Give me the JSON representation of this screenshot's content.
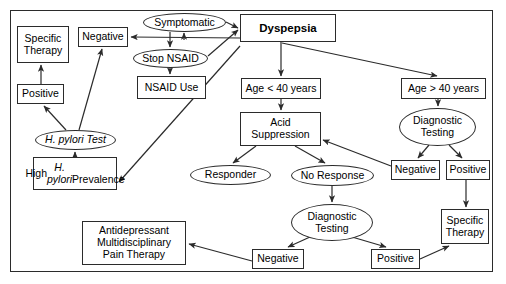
{
  "diagram": {
    "border_color": "#2b2b2b",
    "background": "#ffffff",
    "nodes": [
      {
        "id": "specific_therapy_left",
        "label": "Specific\nTherapy",
        "shape": "box",
        "x": 17,
        "y": 26,
        "w": 52,
        "h": 37
      },
      {
        "id": "negative_top",
        "label": "Negative",
        "shape": "box",
        "x": 78,
        "y": 27,
        "w": 50,
        "h": 20
      },
      {
        "id": "symptomatic",
        "label": "Symptomatic",
        "shape": "ellipse",
        "x": 143,
        "y": 13,
        "w": 83,
        "h": 19
      },
      {
        "id": "dyspepsia",
        "label": "Dyspepsia",
        "shape": "box",
        "x": 240,
        "y": 14,
        "w": 96,
        "h": 28,
        "bold": true
      },
      {
        "id": "stop_nsaid",
        "label": "Stop NSAID",
        "shape": "ellipse",
        "x": 133,
        "y": 49,
        "w": 75,
        "h": 19
      },
      {
        "id": "positive_left",
        "label": "Positive",
        "shape": "box",
        "x": 17,
        "y": 84,
        "w": 47,
        "h": 20
      },
      {
        "id": "nsaid_use",
        "label": "NSAID Use",
        "shape": "box",
        "x": 137,
        "y": 76,
        "w": 69,
        "h": 23
      },
      {
        "id": "age_under_40",
        "label": "Age < 40 years",
        "shape": "box",
        "x": 241,
        "y": 78,
        "w": 80,
        "h": 21
      },
      {
        "id": "age_over_40",
        "label": "Age > 40 years",
        "shape": "box",
        "x": 401,
        "y": 78,
        "w": 85,
        "h": 21
      },
      {
        "id": "h_pylori_test",
        "label": "H. pylori Test",
        "shape": "ellipse",
        "x": 35,
        "y": 130,
        "w": 81,
        "h": 20,
        "italic": true
      },
      {
        "id": "acid_suppression",
        "label": "Acid\nSuppression",
        "shape": "box",
        "x": 240,
        "y": 112,
        "w": 81,
        "h": 34
      },
      {
        "id": "diagnostic_testing_right",
        "label": "Diagnostic\nTesting",
        "shape": "ellipse",
        "x": 399,
        "y": 108,
        "w": 77,
        "h": 38
      },
      {
        "id": "high_h_pylori",
        "label": "High H. pylori\nPrevalence",
        "shape": "box",
        "x": 33,
        "y": 157,
        "w": 84,
        "h": 33,
        "italic_part": true
      },
      {
        "id": "responder",
        "label": "Responder",
        "shape": "ellipse",
        "x": 190,
        "y": 165,
        "w": 81,
        "h": 20
      },
      {
        "id": "no_response",
        "label": "No Response",
        "shape": "ellipse",
        "x": 291,
        "y": 165,
        "w": 83,
        "h": 21
      },
      {
        "id": "negative_right",
        "label": "Negative",
        "shape": "box",
        "x": 391,
        "y": 160,
        "w": 49,
        "h": 20
      },
      {
        "id": "positive_right",
        "label": "Positive",
        "shape": "box",
        "x": 446,
        "y": 160,
        "w": 44,
        "h": 20
      },
      {
        "id": "diagnostic_testing_mid",
        "label": "Diagnostic\nTesting",
        "shape": "ellipse",
        "x": 291,
        "y": 204,
        "w": 82,
        "h": 37
      },
      {
        "id": "specific_therapy_right",
        "label": "Specific\nTherapy",
        "shape": "box",
        "x": 441,
        "y": 209,
        "w": 48,
        "h": 35
      },
      {
        "id": "antidepressant",
        "label": "Antidepressant\nMultidisciplinary\nPain Therapy",
        "shape": "box",
        "x": 82,
        "y": 221,
        "w": 104,
        "h": 44
      },
      {
        "id": "negative_bottom",
        "label": "Negative",
        "shape": "box",
        "x": 252,
        "y": 249,
        "w": 52,
        "h": 20
      },
      {
        "id": "positive_bottom",
        "label": "Positive",
        "shape": "box",
        "x": 371,
        "y": 249,
        "w": 49,
        "h": 20
      }
    ],
    "edges": [
      {
        "from": "symptomatic",
        "to": "dyspepsia",
        "label": ""
      },
      {
        "from": "stop_nsaid",
        "to": "dyspepsia",
        "label": ""
      },
      {
        "from": "dyspepsia",
        "to": "symptomatic",
        "label": ""
      },
      {
        "from": "symptomatic",
        "to": "stop_nsaid",
        "label": ""
      },
      {
        "from": "stop_nsaid",
        "to": "nsaid_use",
        "label": ""
      },
      {
        "from": "dyspepsia",
        "to": "age_under_40",
        "label": ""
      },
      {
        "from": "dyspepsia",
        "to": "age_over_40",
        "label": ""
      },
      {
        "from": "dyspepsia",
        "to": "negative_top",
        "label": ""
      },
      {
        "from": "age_under_40",
        "to": "acid_suppression",
        "label": ""
      },
      {
        "from": "age_over_40",
        "to": "diagnostic_testing_right",
        "label": ""
      },
      {
        "from": "h_pylori_test",
        "to": "positive_left",
        "label": ""
      },
      {
        "from": "h_pylori_test",
        "to": "negative_top",
        "label": ""
      },
      {
        "from": "positive_left",
        "to": "specific_therapy_left",
        "label": ""
      },
      {
        "from": "high_h_pylori",
        "to": "h_pylori_test",
        "label": ""
      },
      {
        "from": "nsaid_use",
        "to": "high_h_pylori",
        "label": ""
      },
      {
        "from": "acid_suppression",
        "to": "responder",
        "label": ""
      },
      {
        "from": "acid_suppression",
        "to": "no_response",
        "label": ""
      },
      {
        "from": "no_response",
        "to": "diagnostic_testing_mid",
        "label": ""
      },
      {
        "from": "diagnostic_testing_right",
        "to": "negative_right",
        "label": ""
      },
      {
        "from": "diagnostic_testing_right",
        "to": "positive_right",
        "label": ""
      },
      {
        "from": "negative_right",
        "to": "acid_suppression",
        "label": ""
      },
      {
        "from": "positive_right",
        "to": "specific_therapy_right",
        "label": ""
      },
      {
        "from": "diagnostic_testing_mid",
        "to": "negative_bottom",
        "label": ""
      },
      {
        "from": "diagnostic_testing_mid",
        "to": "positive_bottom",
        "label": ""
      },
      {
        "from": "negative_bottom",
        "to": "antidepressant",
        "label": ""
      },
      {
        "from": "positive_bottom",
        "to": "specific_therapy_right",
        "label": ""
      }
    ]
  }
}
